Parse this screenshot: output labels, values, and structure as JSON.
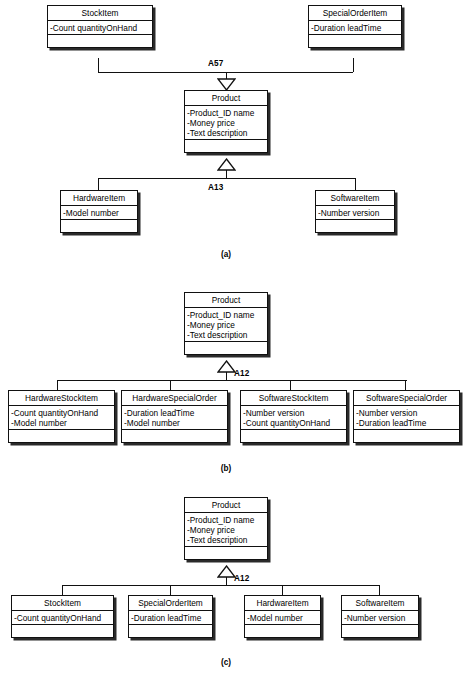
{
  "figure": {
    "type": "uml-class-diagram",
    "line_color": "#111111",
    "box_fill": "#ffffff",
    "shadow_color": "#2a2a2a"
  },
  "panels": [
    {
      "id": "a",
      "caption": "(a)",
      "associations": [
        {
          "name": "A57",
          "label": "A57"
        },
        {
          "name": "A13",
          "label": "A13"
        }
      ],
      "classes": {
        "stock_item": {
          "name": "StockItem",
          "attributes": [
            "-Count quantityOnHand"
          ],
          "operations": []
        },
        "special_order_item": {
          "name": "SpecialOrderItem",
          "attributes": [
            "-Duration leadTime"
          ],
          "operations": []
        },
        "product": {
          "name": "Product",
          "attributes": [
            "-Product_ID name",
            "-Money price",
            "-Text description"
          ],
          "operations": []
        },
        "hardware_item": {
          "name": "HardwareItem",
          "attributes": [
            "-Model number"
          ],
          "operations": []
        },
        "software_item": {
          "name": "SoftwareItem",
          "attributes": [
            "-Number version"
          ],
          "operations": []
        }
      }
    },
    {
      "id": "b",
      "caption": "(b)",
      "associations": [
        {
          "name": "A12",
          "label": "A12"
        }
      ],
      "classes": {
        "product": {
          "name": "Product",
          "attributes": [
            "-Product_ID name",
            "-Money price",
            "-Text description"
          ],
          "operations": []
        },
        "hardware_stock_item": {
          "name": "HardwareStockItem",
          "attributes": [
            "-Count quantityOnHand",
            "-Model number"
          ],
          "operations": []
        },
        "hardware_special_order": {
          "name": "HardwareSpecialOrder",
          "attributes": [
            "-Duration leadTime",
            "-Model number"
          ],
          "operations": []
        },
        "software_stock_item": {
          "name": "SoftwareStockItem",
          "attributes": [
            "-Number version",
            "-Count quantityOnHand"
          ],
          "operations": []
        },
        "software_special_order": {
          "name": "SoftwareSpecialOrder",
          "attributes": [
            "-Number version",
            "-Duration leadTime"
          ],
          "operations": []
        }
      }
    },
    {
      "id": "c",
      "caption": "(c)",
      "associations": [
        {
          "name": "A12",
          "label": "A12"
        }
      ],
      "classes": {
        "product": {
          "name": "Product",
          "attributes": [
            "-Product_ID name",
            "-Money price",
            "-Text description"
          ],
          "operations": []
        },
        "stock_item": {
          "name": "StockItem",
          "attributes": [
            "-Count quantityOnHand"
          ],
          "operations": []
        },
        "special_order_item": {
          "name": "SpecialOrderItem",
          "attributes": [
            "-Duration leadTime"
          ],
          "operations": []
        },
        "hardware_item": {
          "name": "HardwareItem",
          "attributes": [
            "-Model number"
          ],
          "operations": []
        },
        "software_item": {
          "name": "SoftwareItem",
          "attributes": [
            "-Number version"
          ],
          "operations": []
        }
      }
    }
  ]
}
